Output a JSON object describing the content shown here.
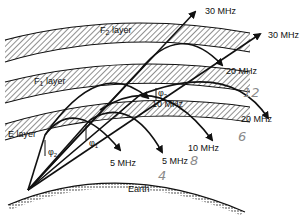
{
  "layers": [
    {
      "name": "F2",
      "label_main": "F",
      "label_sub": "2",
      "label_rest": " layer"
    },
    {
      "name": "F1",
      "label_main": "F",
      "label_sub": "1",
      "label_rest": " layer"
    },
    {
      "name": "E",
      "label_main": "E layer"
    }
  ],
  "earth_label": "Earth",
  "angles": [
    {
      "name": "phi2",
      "label": "φ",
      "sub": "2"
    },
    {
      "name": "phi1",
      "label": "φ",
      "sub": "1"
    },
    {
      "name": "phi3",
      "label": "φ",
      "sub": "3"
    }
  ],
  "frequency_labels": {
    "f30a": "30 MHz",
    "f30b": "30 MHz",
    "f20a": "20 MHz",
    "f20b": "20 MHz",
    "f10a": "10 MHz",
    "f10b": "10 MHz",
    "f5a": "5 MHz",
    "f5b": "5 MHz"
  },
  "handwritten": {
    "n12": "12",
    "n6": "6",
    "n8": "8",
    "n4": "4"
  },
  "colors": {
    "ink": "#111111",
    "pencil": "#8a8a8a"
  }
}
